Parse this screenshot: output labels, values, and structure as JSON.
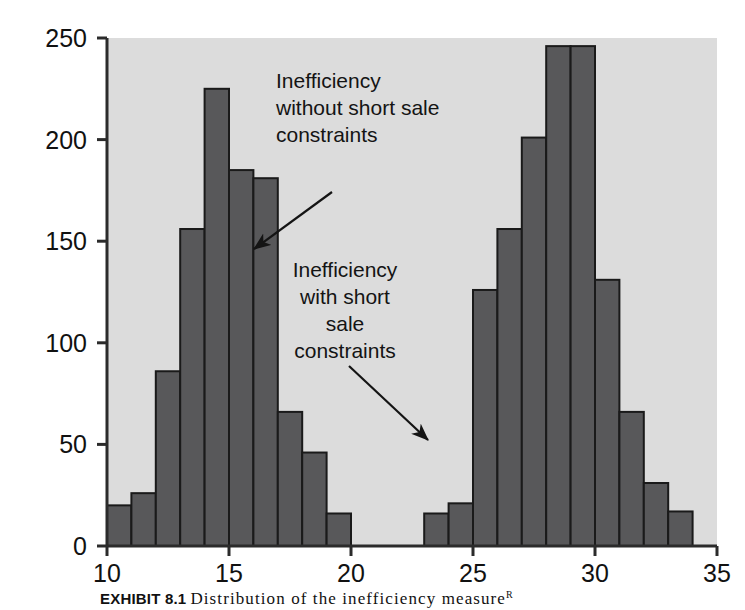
{
  "figure": {
    "caption_label": "EXHIBIT 8.1",
    "caption_text": "Distribution of the inefficiency measure",
    "caption_superscript": "R"
  },
  "chart_data": {
    "type": "bar",
    "title": "",
    "subtitle": "",
    "xlabel": "",
    "ylabel": "",
    "xlim": [
      10,
      35
    ],
    "ylim": [
      0,
      250
    ],
    "xticks": [
      10,
      15,
      20,
      25,
      30,
      35
    ],
    "yticks": [
      0,
      50,
      100,
      150,
      200,
      250
    ],
    "grid": false,
    "legend": "none",
    "bar_color": "#58585a",
    "bar_edge_color": "#1a1a1a",
    "plot_background": "#dcdcdc",
    "axis_color": "#2b2b2b",
    "bin_width": 1,
    "series": [
      {
        "name": "Inefficiency without short sale constraints",
        "bin_starts": [
          10,
          11,
          12,
          13,
          14,
          15,
          16,
          17
        ],
        "values": [
          20,
          26,
          86,
          156,
          225,
          185,
          181,
          66
        ]
      },
      {
        "name": "Inefficiency without short sale constraints (tail)",
        "bin_starts": [
          17,
          18
        ],
        "values": [
          46,
          16
        ]
      },
      {
        "name": "Inefficiency with short sale constraints",
        "bin_starts": [
          23,
          24,
          25,
          26,
          27,
          28,
          29,
          30,
          31,
          32,
          33
        ],
        "values": [
          16,
          21,
          126,
          156,
          201,
          246,
          246,
          131,
          66,
          31,
          17
        ]
      }
    ],
    "bars": [
      {
        "start": 10,
        "value": 20
      },
      {
        "start": 11,
        "value": 26
      },
      {
        "start": 12,
        "value": 86
      },
      {
        "start": 13,
        "value": 156
      },
      {
        "start": 14,
        "value": 225
      },
      {
        "start": 15,
        "value": 185
      },
      {
        "start": 16,
        "value": 181
      },
      {
        "start": 17,
        "value": 66
      },
      {
        "start": 18,
        "value": 46
      },
      {
        "start": 19,
        "value": 16
      },
      {
        "start": 23,
        "value": 16
      },
      {
        "start": 24,
        "value": 21
      },
      {
        "start": 25,
        "value": 126
      },
      {
        "start": 26,
        "value": 156
      },
      {
        "start": 27,
        "value": 201
      },
      {
        "start": 28,
        "value": 246
      },
      {
        "start": 29,
        "value": 246
      },
      {
        "start": 30,
        "value": 131
      },
      {
        "start": 31,
        "value": 66
      },
      {
        "start": 32,
        "value": 31
      },
      {
        "start": 33,
        "value": 17
      }
    ],
    "annotations": [
      {
        "id": "upper",
        "lines": [
          "Inefficiency",
          "without short sale",
          "constraints"
        ],
        "align": "start",
        "text_x": 276,
        "text_y": 88,
        "line_height": 27,
        "arrow_from": [
          332,
          192
        ],
        "arrow_to": [
          254,
          249
        ]
      },
      {
        "id": "lower",
        "lines": [
          "Inefficiency",
          "with short",
          "sale",
          "constraints"
        ],
        "align": "middle",
        "text_x": 345,
        "text_y": 277,
        "line_height": 27,
        "arrow_from": [
          349,
          366
        ],
        "arrow_to": [
          428,
          440
        ]
      }
    ]
  }
}
